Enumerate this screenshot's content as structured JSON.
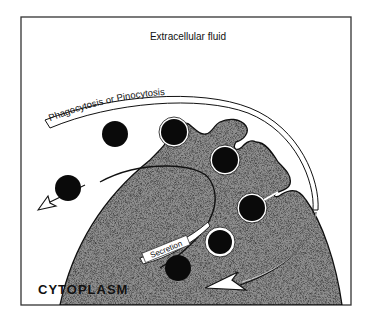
{
  "diagram": {
    "title": "Extracellular fluid",
    "labels": {
      "uptake_arrow": "Phagocytosis or Pinocytosis",
      "secretion_arrow": "Secretion",
      "cell_region": "CYTOPLASM"
    },
    "components": {
      "cell": "cytoplasm",
      "free_particles_outside": 3,
      "particles_being_engulfed": 3,
      "vesicles_inside": 2,
      "particle_inside_free": 1
    },
    "colors": {
      "frame": "#333333",
      "particle": "#0a0a0a",
      "cytoplasm": "#8a8a8a",
      "background": "#ffffff"
    }
  }
}
